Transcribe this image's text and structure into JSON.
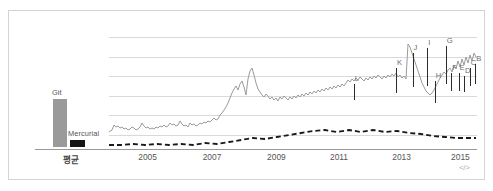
{
  "chart_data": {
    "type": "line",
    "title": "",
    "xlabel": "",
    "ylabel": "",
    "x_tick_labels": [
      "2005",
      "2007",
      "2009",
      "2011",
      "2013",
      "2015"
    ],
    "x_tick_positions_pct": [
      10.5,
      28.0,
      45.5,
      62.5,
      79.5,
      95.5
    ],
    "gridlines": 6,
    "grid": true,
    "legend_position": "none",
    "average_panel": {
      "axis_label": "평균",
      "bars": [
        {
          "name": "Git",
          "label": "Git",
          "value": 48,
          "color": "#9a9a9a"
        },
        {
          "name": "Mercurial",
          "label": "Mercurial",
          "value": 7,
          "color": "#151515"
        }
      ]
    },
    "series": [
      {
        "name": "Git",
        "style": "solid",
        "color": "#9b9b9b",
        "points": "0,97 3,95 5,90 7,92 9,91 11,93 13,92 15,94 17,93 19,95 21,94 23,92 25,93 27,95 29,94 31,92 33,88 35,91 37,93 39,92 41,94 43,93 45,94 47,92 49,93 51,91 53,92 55,90 57,92 59,91 61,88 63,90 65,89 67,91 69,90 71,86 73,89 75,91 77,90 79,92 81,88 83,90 85,89 87,91 89,90 91,88 93,89 95,87 97,88 99,86 101,87 103,85 105,83 107,85 109,84 111,80 113,78 115,75 117,72 119,68 121,63 123,58 125,54 127,51 129,55 131,49 133,46 135,52 137,60 139,44 141,36 143,33 145,40 147,48 149,54 151,57 153,60 155,62 157,59 159,61 161,64 163,62 165,65 167,63 169,66 171,62 173,64 175,61 177,63 179,65 181,62 183,64 185,61 187,63 189,60 191,62 193,59 195,61 197,58 199,60 201,57 203,59 205,56 207,58 209,55 211,57 213,54 215,56 217,53 219,55 221,52 223,54 225,51 227,53 229,50 231,52 233,49 235,51 237,48 239,45 241,47 243,44 245,46 247,43 249,45 251,42 253,44 255,46 257,43 259,45 261,42 263,44 265,41 267,43 269,40 271,42 273,44 275,41 277,43 279,40 281,42 283,39 285,41 287,38 289,42 291,40 293,43 295,41 297,44 299,9 301,12 303,18 305,24 307,30 309,36 311,42 313,48 315,52 317,56 319,58 321,60 323,58 325,55 327,51 329,47 331,43 333,40 335,37 337,39 339,35 341,33 343,37 345,30 347,34 349,26 351,32 353,24 355,30 357,22 359,28 361,20 363,26 365,18 367,22"
      },
      {
        "name": "Mercurial",
        "style": "dashed",
        "color": "#1a1a1a",
        "points": "0,110 12,110 24,109 36,110 48,109 60,110 72,109 84,110 96,108 108,109 120,107 132,105 144,103 156,104 168,102 180,100 192,98 204,96 216,95 228,97 240,95 252,97 264,95 276,97 288,96 300,98 312,99 324,101 336,102 348,103 360,103 367,103"
      }
    ],
    "annotations": [
      {
        "letter": "L",
        "x_pct": 66.5,
        "y_top_pct": 36,
        "stem_h_pct": 14
      },
      {
        "letter": "K",
        "x_pct": 78.0,
        "y_top_pct": 22,
        "stem_h_pct": 22
      },
      {
        "letter": "J",
        "x_pct": 82.5,
        "y_top_pct": 9,
        "stem_h_pct": 30
      },
      {
        "letter": "I",
        "x_pct": 86.5,
        "y_top_pct": 4,
        "stem_h_pct": 34
      },
      {
        "letter": "H",
        "x_pct": 88.5,
        "y_top_pct": 33,
        "stem_h_pct": 20
      },
      {
        "letter": "G",
        "x_pct": 91.5,
        "y_top_pct": 3,
        "stem_h_pct": 33
      },
      {
        "letter": "F",
        "x_pct": 93.0,
        "y_top_pct": 26,
        "stem_h_pct": 16
      },
      {
        "letter": "E",
        "x_pct": 95.0,
        "y_top_pct": 26,
        "stem_h_pct": 16
      },
      {
        "letter": "D",
        "x_pct": 96.5,
        "y_top_pct": 29,
        "stem_h_pct": 14
      },
      {
        "letter": "C",
        "x_pct": 98.0,
        "y_top_pct": 22,
        "stem_h_pct": 16
      },
      {
        "letter": "B",
        "x_pct": 99.5,
        "y_top_pct": 18,
        "stem_h_pct": 18
      }
    ]
  },
  "embed_icon": "</>"
}
